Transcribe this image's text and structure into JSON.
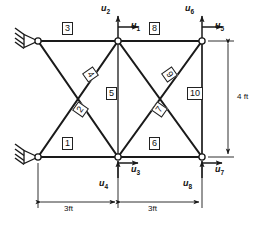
{
  "diagram": {
    "units": "ft",
    "colors": {
      "line": "#1a1a1a",
      "node_fill": "#ffffff",
      "background": "#ffffff",
      "label_border": "#222222"
    }
  },
  "nodes": [
    {
      "id": "n1",
      "name": "top-left-support-node",
      "x": 38,
      "y": 41,
      "support": "pin"
    },
    {
      "id": "n2",
      "name": "top-middle-node",
      "x": 118,
      "y": 41,
      "support": "none"
    },
    {
      "id": "n3",
      "name": "top-right-node",
      "x": 202,
      "y": 41,
      "support": "none"
    },
    {
      "id": "n4",
      "name": "bottom-left-support-node",
      "x": 38,
      "y": 157,
      "support": "pin"
    },
    {
      "id": "n5",
      "name": "bottom-middle-node",
      "x": 118,
      "y": 157,
      "support": "none"
    },
    {
      "id": "n6",
      "name": "bottom-right-node",
      "x": 202,
      "y": 157,
      "support": "none"
    }
  ],
  "members": [
    {
      "number": "1",
      "from": "n4",
      "to": "n5",
      "orientation": "horizontal",
      "label_x": 68,
      "label_y": 143
    },
    {
      "number": "2",
      "from": "n4",
      "to": "n2",
      "orientation": "diag-up",
      "label_x": 81,
      "label_y": 109,
      "rotate": -55
    },
    {
      "number": "3",
      "from": "n1",
      "to": "n2",
      "orientation": "horizontal",
      "label_x": 68,
      "label_y": 28
    },
    {
      "number": "4",
      "from": "n1",
      "to": "n5",
      "orientation": "diag-down",
      "label_x": 91,
      "label_y": 74,
      "rotate": 55
    },
    {
      "number": "5",
      "from": "n2",
      "to": "n5",
      "orientation": "vertical",
      "label_x": 112,
      "label_y": 93
    },
    {
      "number": "6",
      "from": "n5",
      "to": "n6",
      "orientation": "horizontal",
      "label_x": 155,
      "label_y": 143
    },
    {
      "number": "7",
      "from": "n5",
      "to": "n3",
      "orientation": "diag-up",
      "label_x": 160,
      "label_y": 109,
      "rotate": -55
    },
    {
      "number": "8",
      "from": "n2",
      "to": "n3",
      "orientation": "horizontal",
      "label_x": 155,
      "label_y": 28
    },
    {
      "number": "9",
      "from": "n2",
      "to": "n6",
      "orientation": "diag-down",
      "label_x": 170,
      "label_y": 74,
      "rotate": 55
    },
    {
      "number": "10",
      "from": "n3",
      "to": "n6",
      "orientation": "vertical",
      "label_x": 192,
      "label_y": 93
    }
  ],
  "dof_arrows": [
    {
      "id": "u1",
      "label": "u",
      "sub": "1",
      "node": "n2",
      "direction": "right",
      "text_x": 131,
      "text_y": 23
    },
    {
      "id": "u2",
      "label": "u",
      "sub": "2",
      "node": "n2",
      "direction": "up",
      "text_x": 101,
      "text_y": 6
    },
    {
      "id": "u3",
      "label": "u",
      "sub": "3",
      "node": "n5",
      "direction": "right",
      "text_x": 131,
      "text_y": 167
    },
    {
      "id": "u4",
      "label": "u",
      "sub": "4",
      "node": "n5",
      "direction": "up",
      "text_x": 100,
      "text_y": 181
    },
    {
      "id": "u5",
      "label": "u",
      "sub": "5",
      "node": "n3",
      "direction": "right",
      "text_x": 215,
      "text_y": 23
    },
    {
      "id": "u6",
      "label": "u",
      "sub": "6",
      "node": "n3",
      "direction": "up",
      "text_x": 185,
      "text_y": 6
    },
    {
      "id": "u7",
      "label": "u",
      "sub": "7",
      "node": "n6",
      "direction": "right",
      "text_x": 215,
      "text_y": 167
    },
    {
      "id": "u8",
      "label": "u",
      "sub": "8",
      "node": "n6",
      "direction": "up",
      "text_x": 184,
      "text_y": 181
    }
  ],
  "dimensions": [
    {
      "id": "dim-left",
      "text": "3ft",
      "axis": "horizontal",
      "from_x": 38,
      "to_x": 118,
      "y": 202,
      "text_x": 68,
      "text_y": 205
    },
    {
      "id": "dim-right",
      "text": "3ft",
      "axis": "horizontal",
      "from_x": 118,
      "to_x": 202,
      "y": 202,
      "text_x": 152,
      "text_y": 205
    },
    {
      "id": "dim-vertical",
      "text": "4 ft",
      "axis": "vertical",
      "from_y": 41,
      "to_y": 157,
      "x": 228,
      "text_x": 237,
      "text_y": 93
    }
  ],
  "supports": [
    {
      "id": "support-top-left",
      "node": "n1",
      "type": "pin",
      "hatch_count": 4
    },
    {
      "id": "support-bottom-left",
      "node": "n4",
      "type": "pin",
      "hatch_count": 4
    }
  ]
}
